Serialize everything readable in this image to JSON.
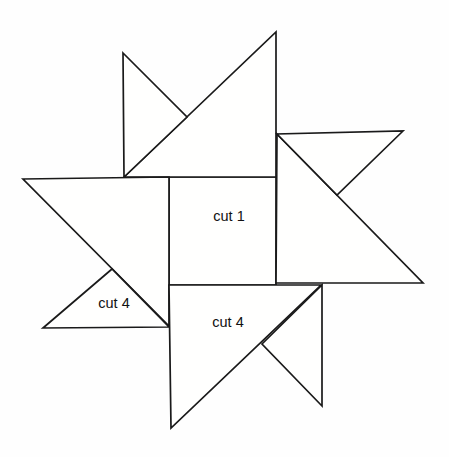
{
  "figure": {
    "type": "quilt-block-piecing-diagram",
    "canvas": {
      "width": 449,
      "height": 457
    },
    "colors": {
      "background": "#fefefe",
      "line": "#1a1a1a",
      "piece_fill": "#fffffe",
      "label_text": "#111111"
    },
    "stroke_width": 1.7,
    "pieces": [
      {
        "name": "center-square",
        "label": "cut 1",
        "points": [
          [
            169,
            177
          ],
          [
            276,
            177
          ],
          [
            276,
            285
          ],
          [
            169,
            285
          ]
        ]
      },
      {
        "name": "top-large-triangle",
        "label": "",
        "points": [
          [
            124,
            177
          ],
          [
            276,
            32
          ],
          [
            276,
            177
          ]
        ]
      },
      {
        "name": "top-star-point-triangle",
        "label": "",
        "points": [
          [
            123,
            53
          ],
          [
            187,
            117
          ],
          [
            124,
            177
          ]
        ]
      },
      {
        "name": "right-large-triangle",
        "label": "",
        "points": [
          [
            277,
            134
          ],
          [
            423,
            283
          ],
          [
            276,
            283
          ]
        ]
      },
      {
        "name": "right-star-point-triangle",
        "label": "",
        "points": [
          [
            403,
            131
          ],
          [
            337,
            195
          ],
          [
            277,
            134
          ]
        ]
      },
      {
        "name": "left-large-triangle",
        "label": "",
        "points": [
          [
            23,
            179
          ],
          [
            169,
            177
          ],
          [
            169,
            326
          ]
        ]
      },
      {
        "name": "left-star-point-triangle",
        "label": "cut 4",
        "points": [
          [
            112,
            269
          ],
          [
            43,
            328
          ],
          [
            169,
            327
          ]
        ]
      },
      {
        "name": "bottom-large-triangle",
        "label": "cut 4",
        "points": [
          [
            169,
            285
          ],
          [
            321,
            285
          ],
          [
            171,
            428
          ]
        ]
      },
      {
        "name": "bottom-star-point-triangle",
        "label": "",
        "points": [
          [
            322,
            285
          ],
          [
            322,
            406
          ],
          [
            262,
            344
          ]
        ]
      }
    ],
    "labels": [
      {
        "name": "label-cut-1",
        "text": "cut 1",
        "x": 229,
        "y": 221
      },
      {
        "name": "label-cut-4-left",
        "text": "cut 4",
        "x": 114,
        "y": 308
      },
      {
        "name": "label-cut-4-bottom",
        "text": "cut 4",
        "x": 228,
        "y": 327
      }
    ]
  }
}
